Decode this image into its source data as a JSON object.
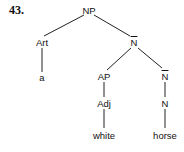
{
  "example_number": "43.",
  "tree": {
    "nodes": {
      "np": {
        "label": "NP"
      },
      "art": {
        "label": "Art"
      },
      "nbar1": {
        "label": "N",
        "bar": true
      },
      "a": {
        "label": "a"
      },
      "ap": {
        "label": "AP"
      },
      "nbar2": {
        "label": "N",
        "bar": true
      },
      "adj": {
        "label": "Adj"
      },
      "n": {
        "label": "N"
      },
      "white": {
        "label": "white"
      },
      "horse": {
        "label": "horse"
      }
    },
    "edges": [
      [
        "NP",
        "Art"
      ],
      [
        "NP",
        "N-bar"
      ],
      [
        "Art",
        "a"
      ],
      [
        "N-bar",
        "AP"
      ],
      [
        "N-bar",
        "N-bar"
      ],
      [
        "AP",
        "Adj"
      ],
      [
        "Adj",
        "white"
      ],
      [
        "N-bar",
        "N"
      ],
      [
        "N",
        "horse"
      ]
    ]
  }
}
